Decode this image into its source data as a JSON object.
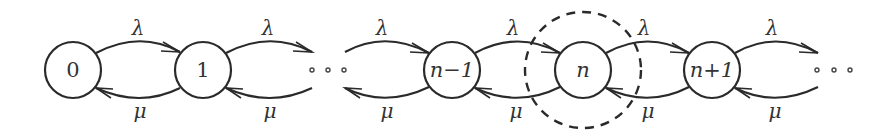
{
  "diagram": {
    "type": "birth-death-chain",
    "nodes": [
      {
        "id": "0",
        "label": "0"
      },
      {
        "id": "1",
        "label": "1"
      },
      {
        "id": "n-1",
        "label": "n−1"
      },
      {
        "id": "n",
        "label": "n"
      },
      {
        "id": "n+1",
        "label": "n+1"
      }
    ],
    "ellipsis": "• • •",
    "forward_rate_label": "λ",
    "backward_rate_label": "μ",
    "edges": [
      {
        "from": "0",
        "to": "1",
        "label": "λ"
      },
      {
        "from": "1",
        "to": "0",
        "label": "μ"
      },
      {
        "from": "1",
        "to": "…",
        "label": "λ"
      },
      {
        "from": "…",
        "to": "1",
        "label": "μ"
      },
      {
        "from": "…",
        "to": "n-1",
        "label": "λ"
      },
      {
        "from": "n-1",
        "to": "…",
        "label": "μ"
      },
      {
        "from": "n-1",
        "to": "n",
        "label": "λ"
      },
      {
        "from": "n",
        "to": "n-1",
        "label": "μ"
      },
      {
        "from": "n",
        "to": "n+1",
        "label": "λ"
      },
      {
        "from": "n+1",
        "to": "n",
        "label": "μ"
      },
      {
        "from": "n+1",
        "to": "…",
        "label": "λ"
      },
      {
        "from": "…",
        "to": "n+1",
        "label": "μ"
      }
    ],
    "highlight": {
      "node": "n",
      "style": "dashed-circle"
    }
  }
}
